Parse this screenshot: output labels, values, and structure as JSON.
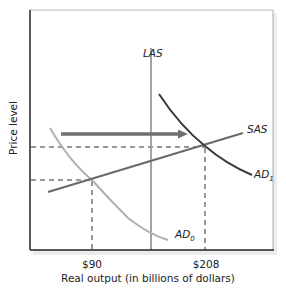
{
  "diagram": {
    "type": "aggregate-demand-supply",
    "y_axis_label": "Price level",
    "x_axis_label": "Real output (in billions of dollars)",
    "x_ticks": [
      {
        "label": "$90",
        "value": 90
      },
      {
        "label": "$208",
        "value": 208
      }
    ],
    "curves": {
      "las": {
        "label": "LAS",
        "color": "#9a9a9a"
      },
      "sas": {
        "label": "SAS",
        "color": "#6a6a6a"
      },
      "ad0": {
        "label": "AD",
        "subscript": "0",
        "color": "#b0b0b0"
      },
      "ad1": {
        "label": "AD",
        "subscript": "1",
        "color": "#3a3a3a"
      }
    },
    "shift_arrow": {
      "from": "AD0",
      "to": "AD1",
      "color": "#707070"
    },
    "equilibria": [
      {
        "name": "initial",
        "output": "$90",
        "curve": "AD0 ∩ SAS"
      },
      {
        "name": "new",
        "output": "$208",
        "curve": "AD1 ∩ SAS"
      }
    ],
    "colors": {
      "axis": "#222222",
      "frame": "#b8b8b8",
      "dashed": "#333333"
    }
  }
}
